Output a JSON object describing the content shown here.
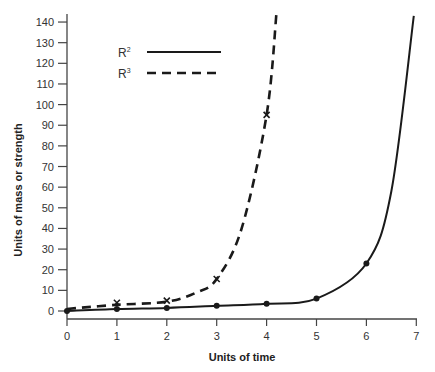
{
  "chart_data": {
    "type": "line",
    "title": "",
    "xlabel": "Units of time",
    "ylabel": "Units of mass or strength",
    "xlim": [
      0,
      7
    ],
    "ylim": [
      0,
      145
    ],
    "x_ticks": [
      "0",
      "1",
      "2",
      "3",
      "4",
      "5",
      "6",
      "7"
    ],
    "y_ticks": [
      "0",
      "10",
      "20",
      "30",
      "40",
      "50",
      "60",
      "70",
      "80",
      "90",
      "100",
      "110",
      "120",
      "130",
      "140"
    ],
    "grid": false,
    "legend_position": "upper-left-inside",
    "series": [
      {
        "name": "R²",
        "style": "solid",
        "marker": "dot",
        "x": [
          0,
          1,
          2,
          3,
          4,
          5,
          6
        ],
        "values": [
          0,
          1,
          1.5,
          2.5,
          3.5,
          6,
          23
        ],
        "curve_continues_to": {
          "x": 6.95,
          "y": 143
        }
      },
      {
        "name": "R³",
        "style": "dashed",
        "marker": "x",
        "x": [
          1,
          2,
          3,
          4
        ],
        "values": [
          4,
          5,
          15.5,
          95
        ],
        "curve_starts_at": {
          "x": 0,
          "y": 1
        },
        "curve_continues_to": {
          "x": 4.2,
          "y": 145
        }
      }
    ]
  },
  "legend": {
    "r2_base": "R",
    "r2_sup": "2",
    "r3_base": "R",
    "r3_sup": "3"
  },
  "colors": {
    "line": "#1a1a1a",
    "axis": "#444444",
    "text": "#333333"
  }
}
